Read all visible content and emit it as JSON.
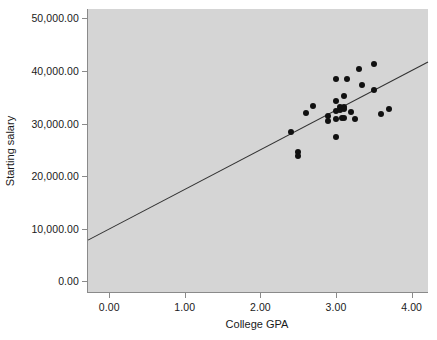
{
  "chart_data": {
    "type": "scatter",
    "title": "",
    "xlabel": "College GPA",
    "ylabel": "Starting salary",
    "xlim": [
      -0.28,
      4.23
    ],
    "ylim": [
      -2200,
      51800
    ],
    "grid": false,
    "legend": null,
    "xticks": [
      0,
      1,
      2,
      3,
      4
    ],
    "xticklabels": [
      "0.00",
      "1.00",
      "2.00",
      "3.00",
      "4.00"
    ],
    "yticks": [
      0,
      10000,
      20000,
      30000,
      40000,
      50000
    ],
    "yticklabels": [
      "0.00",
      "10,000.00",
      "20,000.00",
      "30,000.00",
      "40,000.00",
      "50,000.00"
    ],
    "marker": "filled-circle",
    "marker_color": "#111111",
    "plot_background": "#d5d5d5",
    "page_background": "#ffffff",
    "axis_color": "#8a8a8a",
    "points": [
      {
        "x": 2.4,
        "y": 28400
      },
      {
        "x": 2.5,
        "y": 24600
      },
      {
        "x": 2.5,
        "y": 23900
      },
      {
        "x": 2.6,
        "y": 32100
      },
      {
        "x": 2.7,
        "y": 33300
      },
      {
        "x": 2.9,
        "y": 31400
      },
      {
        "x": 2.9,
        "y": 30600
      },
      {
        "x": 3.0,
        "y": 38500
      },
      {
        "x": 3.0,
        "y": 34400
      },
      {
        "x": 3.0,
        "y": 32400
      },
      {
        "x": 3.0,
        "y": 30900
      },
      {
        "x": 3.0,
        "y": 27500
      },
      {
        "x": 3.05,
        "y": 33100
      },
      {
        "x": 3.05,
        "y": 32600
      },
      {
        "x": 3.08,
        "y": 31000
      },
      {
        "x": 3.1,
        "y": 35300
      },
      {
        "x": 3.1,
        "y": 33100
      },
      {
        "x": 3.1,
        "y": 32700
      },
      {
        "x": 3.1,
        "y": 31000
      },
      {
        "x": 3.15,
        "y": 38500
      },
      {
        "x": 3.2,
        "y": 32300
      },
      {
        "x": 3.25,
        "y": 30900
      },
      {
        "x": 3.3,
        "y": 40400
      },
      {
        "x": 3.35,
        "y": 37400
      },
      {
        "x": 3.5,
        "y": 41300
      },
      {
        "x": 3.5,
        "y": 36400
      },
      {
        "x": 3.6,
        "y": 31900
      },
      {
        "x": 3.7,
        "y": 32700
      }
    ],
    "fit_line": {
      "name": "linear fit",
      "color": "#333333",
      "x_start": -0.28,
      "y_start": 7700,
      "x_end": 4.23,
      "y_end": 41700
    }
  }
}
